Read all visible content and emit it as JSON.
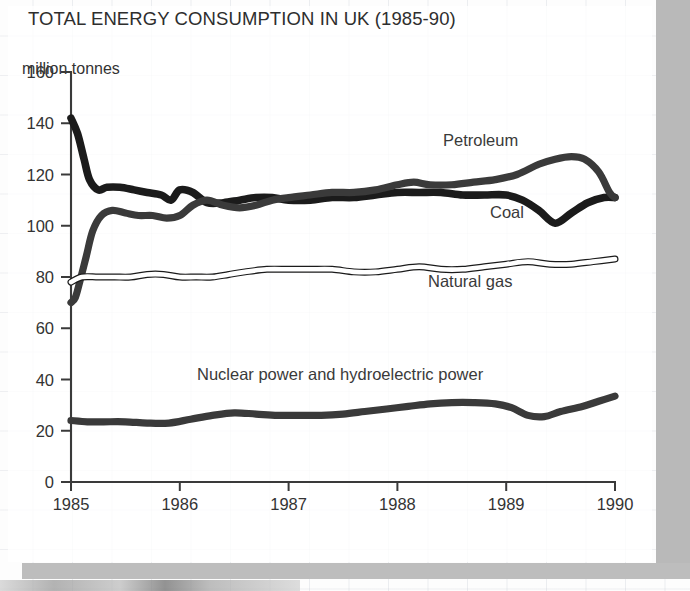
{
  "title": "TOTAL ENERGY CONSUMPTION IN UK (1985-90)",
  "axis_unit_caption": "million tonnes",
  "chart_data": {
    "type": "line",
    "title": "TOTAL ENERGY CONSUMPTION IN UK (1985-90)",
    "xlabel": "",
    "ylabel": "million tonnes",
    "xlim": [
      1985,
      1990
    ],
    "ylim": [
      0,
      160
    ],
    "yticks": [
      0,
      20,
      40,
      60,
      80,
      100,
      120,
      140,
      160
    ],
    "xticks": [
      "1985",
      "1986",
      "1987",
      "1988",
      "1989",
      "1990"
    ],
    "grid": false,
    "legend": "inline-annotations",
    "series": [
      {
        "name": "Coal",
        "style": "thick-solid-black",
        "color": "#1b1b1b",
        "x": [
          1985.0,
          1985.06,
          1985.12,
          1985.17,
          1985.25,
          1985.33,
          1985.45,
          1985.58,
          1985.7,
          1985.83,
          1985.92,
          1986.0,
          1986.12,
          1986.25,
          1986.4,
          1986.55,
          1986.7,
          1986.85,
          1987.0,
          1987.2,
          1987.4,
          1987.6,
          1987.8,
          1988.0,
          1988.2,
          1988.4,
          1988.6,
          1988.8,
          1989.0,
          1989.15,
          1989.3,
          1989.45,
          1989.6,
          1989.75,
          1989.9,
          1990.0
        ],
        "y": [
          142,
          136,
          126,
          118,
          114,
          115,
          115,
          114,
          113,
          112,
          110,
          114,
          113,
          109,
          109,
          110,
          111,
          111,
          110,
          110,
          111,
          111,
          112,
          113,
          113,
          113,
          112,
          112,
          112,
          110,
          106,
          101,
          105,
          109,
          111,
          111
        ]
      },
      {
        "name": "Petroleum",
        "style": "thick-solid-dark-grey",
        "color": "#3a3a3a",
        "x": [
          1985.0,
          1985.04,
          1985.08,
          1985.14,
          1985.2,
          1985.28,
          1985.38,
          1985.5,
          1985.62,
          1985.75,
          1985.88,
          1986.0,
          1986.12,
          1986.25,
          1986.4,
          1986.55,
          1986.7,
          1986.85,
          1987.0,
          1987.2,
          1987.4,
          1987.6,
          1987.8,
          1988.0,
          1988.15,
          1988.3,
          1988.5,
          1988.7,
          1988.9,
          1989.1,
          1989.3,
          1989.45,
          1989.6,
          1989.72,
          1989.85,
          1989.95,
          1990.0
        ],
        "y": [
          70,
          72,
          78,
          88,
          98,
          104,
          106,
          105,
          104,
          104,
          103,
          104,
          108,
          110,
          108,
          107,
          108,
          110,
          111,
          112,
          113,
          113,
          114,
          116,
          117,
          116,
          116,
          117,
          118,
          120,
          124,
          126,
          127,
          126,
          121,
          113,
          111
        ]
      },
      {
        "name": "Natural gas",
        "style": "thin-hollow-white-line",
        "color": "#ffffff",
        "outline": "#1b1b1b",
        "x": [
          1985.0,
          1985.1,
          1985.25,
          1985.4,
          1985.55,
          1985.7,
          1985.85,
          1986.0,
          1986.15,
          1986.3,
          1986.45,
          1986.6,
          1986.8,
          1987.0,
          1987.2,
          1987.4,
          1987.6,
          1987.8,
          1988.0,
          1988.2,
          1988.4,
          1988.6,
          1988.8,
          1989.0,
          1989.2,
          1989.4,
          1989.6,
          1989.8,
          1990.0
        ],
        "y": [
          78,
          80,
          80,
          80,
          80,
          81,
          81,
          80,
          80,
          80,
          81,
          82,
          83,
          83,
          83,
          83,
          82,
          82,
          83,
          84,
          83,
          83,
          84,
          85,
          86,
          85,
          85,
          86,
          87
        ]
      },
      {
        "name": "Nuclear power and hydroelectric power",
        "style": "thick-solid-dark-grey",
        "color": "#3a3a3a",
        "x": [
          1985.0,
          1985.15,
          1985.3,
          1985.5,
          1985.7,
          1985.9,
          1986.1,
          1986.3,
          1986.5,
          1986.7,
          1986.9,
          1987.1,
          1987.3,
          1987.5,
          1987.7,
          1987.9,
          1988.1,
          1988.3,
          1988.5,
          1988.7,
          1988.9,
          1989.05,
          1989.2,
          1989.35,
          1989.5,
          1989.7,
          1989.85,
          1990.0
        ],
        "y": [
          24,
          23.5,
          23.5,
          23.5,
          23,
          23,
          24.5,
          26,
          27,
          26.5,
          26,
          26,
          26,
          26.5,
          27.5,
          28.5,
          29.5,
          30.5,
          31,
          31,
          30.5,
          29,
          26,
          25.5,
          27.5,
          29.5,
          31.5,
          33.5
        ]
      }
    ]
  },
  "y_tick_labels": [
    "0",
    "20",
    "40",
    "60",
    "80",
    "100",
    "120",
    "140",
    "160"
  ],
  "x_tick_labels": [
    "1985",
    "1986",
    "1987",
    "1988",
    "1989",
    "1990"
  ],
  "series_annotations": [
    {
      "label": "Petroleum",
      "x": 443,
      "y": 131
    },
    {
      "label": "Coal",
      "x": 490,
      "y": 203
    },
    {
      "label": "Natural gas",
      "x": 428,
      "y": 272
    },
    {
      "label": "Nuclear power and hydroelectric power",
      "x": 197,
      "y": 365
    }
  ],
  "colors": {
    "coal": "#1b1b1b",
    "petroleum": "#3a3a3a",
    "natural_gas_fill": "#ffffff",
    "natural_gas_outline": "#1b1b1b",
    "nuclear": "#3a3a3a",
    "axis": "#3a3a3a",
    "text": "#333333",
    "paper": "#fdfdfd",
    "scan_band": "#b9b9b9"
  }
}
